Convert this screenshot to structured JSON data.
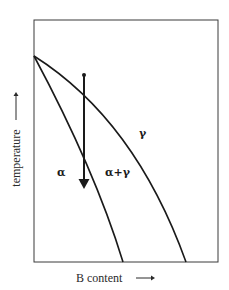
{
  "diagram": {
    "type": "binary phase diagram (schematic)",
    "axes": {
      "x_label": "B content",
      "y_label": "temperature",
      "x_arrow": "right-arrow",
      "y_arrow": "up-arrow"
    },
    "regions": {
      "alpha": "α",
      "alpha_gamma": "α+γ",
      "gamma": "γ"
    },
    "boundaries": [
      {
        "name": "alpha / alpha+gamma boundary",
        "start": "left edge, upper",
        "end": "bottom edge, middle"
      },
      {
        "name": "alpha+gamma / gamma boundary",
        "start": "left edge, upper",
        "end": "bottom edge, right"
      }
    ],
    "cooling_path": {
      "description": "vertical cooling arrow starting at a dot in gamma region, crossing both boundaries into alpha region",
      "direction": "down"
    },
    "colors": {
      "line": "#1a1a1a",
      "frame": "#3a3a3a",
      "background": "#ffffff"
    }
  }
}
